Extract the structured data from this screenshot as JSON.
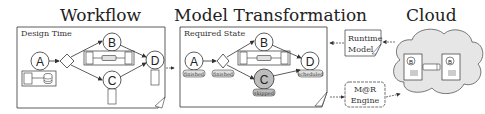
{
  "sections": {
    "workflow": {
      "title": "Workflow",
      "subtitle": "Design Time",
      "nodes": [
        "A",
        "B",
        "C",
        "D"
      ]
    },
    "model_transformation": {
      "title": "Model Transformation",
      "subtitle": "Required State",
      "nodes": [
        "A",
        "B",
        "C",
        "D"
      ],
      "states": {
        "A": "finished",
        "gateway": "finished",
        "C": "skipped",
        "D": "scheduled"
      }
    },
    "cloud": {
      "title": "Cloud",
      "runtime_model": "Runtime Model",
      "runtime_model_line1": "Runtime",
      "runtime_model_line2": "Model",
      "engine": "M@R Engine",
      "engine_line1": "M@R",
      "engine_line2": "Engine",
      "nodes": [
        "B",
        "B"
      ]
    }
  },
  "colors": {
    "line": "#333333",
    "box_fill": "#ffffff",
    "skipped_fill": "#bdbdbd",
    "cloud_fill": "#e6e6e6",
    "badge_fill": "#e0e0e0"
  }
}
